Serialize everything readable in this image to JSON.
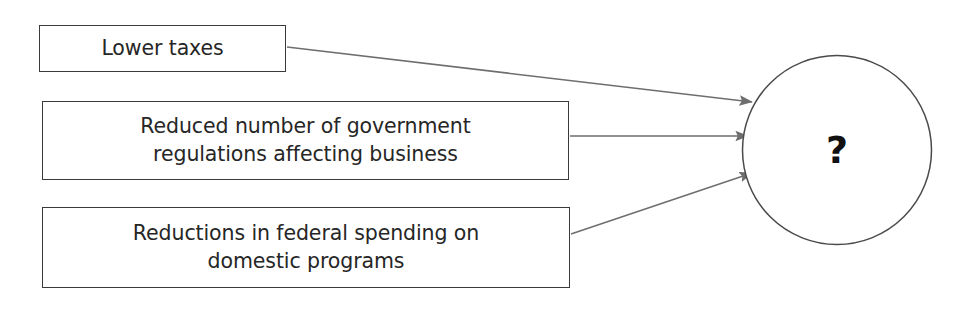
{
  "diagram": {
    "type": "cause-and-effect",
    "background_color": "#ffffff",
    "line_color": "#6e6e6e",
    "box_border_color": "#3a3a3a",
    "text_color": "#262626",
    "causes": [
      {
        "id": "lower-taxes",
        "label": "Lower taxes"
      },
      {
        "id": "regulations",
        "label": "Reduced number of government\nregulations affecting business"
      },
      {
        "id": "spending",
        "label": "Reductions in federal spending on\ndomestic programs"
      }
    ],
    "outcome": {
      "id": "unknown-effect",
      "label": "?",
      "shape": "circle"
    },
    "connectors": [
      {
        "from": "lower-taxes",
        "to": "unknown-effect",
        "style": "arrow"
      },
      {
        "from": "regulations",
        "to": "unknown-effect",
        "style": "arrow"
      },
      {
        "from": "spending",
        "to": "unknown-effect",
        "style": "arrow"
      }
    ]
  }
}
